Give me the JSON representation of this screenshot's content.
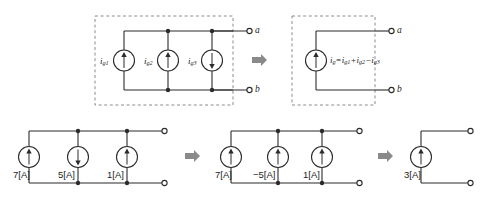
{
  "figure": {
    "ink": "#2b2b2b",
    "dash_color": "#8c8c8c",
    "arrow_color": "#8a8a8a"
  },
  "top_row": {
    "left_circuit": {
      "name": "three parallel current sources",
      "sources": [
        {
          "label_base": "i",
          "label_sub": "g1",
          "direction": "up"
        },
        {
          "label_base": "i",
          "label_sub": "g2",
          "direction": "up"
        },
        {
          "label_base": "i",
          "label_sub": "g3",
          "direction": "down"
        }
      ],
      "terminal_top": "a",
      "terminal_bottom": "b"
    },
    "transform_arrow": "right-arrow",
    "right_circuit": {
      "name": "single equivalent current source",
      "source": {
        "direction": "up"
      },
      "equation": {
        "lhs_base": "i",
        "lhs_sub": "g",
        "eq": "=",
        "t1_base": "i",
        "t1_sub": "g1",
        "op1": "+",
        "t2_base": "i",
        "t2_sub": "g2",
        "op2": "−",
        "t3_base": "i",
        "t3_sub": "g3"
      },
      "terminal_top": "a",
      "terminal_bottom": "b"
    }
  },
  "bottom_row": {
    "circuit_1": {
      "name": "numeric three source circuit",
      "sources": [
        {
          "value": "7[A]",
          "direction": "up"
        },
        {
          "value": "5[A]",
          "direction": "down"
        },
        {
          "value": "1[A]",
          "direction": "up"
        }
      ]
    },
    "arrow_1": "right-arrow",
    "circuit_2": {
      "name": "signed three source circuit",
      "sources": [
        {
          "value": "7[A]",
          "direction": "up"
        },
        {
          "value": "−5[A]",
          "direction": "up"
        },
        {
          "value": "1[A]",
          "direction": "up"
        }
      ]
    },
    "arrow_2": "right-arrow",
    "circuit_3": {
      "name": "combined single source circuit",
      "sources": [
        {
          "value": "3[A]",
          "direction": "up"
        }
      ]
    }
  }
}
